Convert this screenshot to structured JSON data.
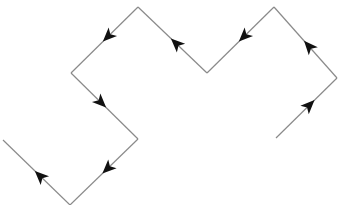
{
  "diagram": {
    "type": "directed-zigzag-path",
    "line_color": "#8a8a8a",
    "arrow_color": "#111111",
    "background": "#ffffff",
    "vertices": [
      [
        276,
        138
      ],
      [
        337,
        78
      ],
      [
        274,
        7
      ],
      [
        207,
        73
      ],
      [
        138,
        7
      ],
      [
        71,
        73
      ],
      [
        138,
        139
      ],
      [
        70,
        205
      ],
      [
        3,
        140
      ]
    ],
    "segments": [
      {
        "from": 0,
        "to": 1,
        "arrow_at": 0.55
      },
      {
        "from": 1,
        "to": 2,
        "arrow_at": 0.45
      },
      {
        "from": 2,
        "to": 3,
        "arrow_at": 0.45
      },
      {
        "from": 3,
        "to": 4,
        "arrow_at": 0.45
      },
      {
        "from": 4,
        "to": 5,
        "arrow_at": 0.45
      },
      {
        "from": 5,
        "to": 6,
        "arrow_at": 0.45
      },
      {
        "from": 6,
        "to": 7,
        "arrow_at": 0.45
      },
      {
        "from": 7,
        "to": 8,
        "arrow_at": 0.45
      }
    ]
  }
}
